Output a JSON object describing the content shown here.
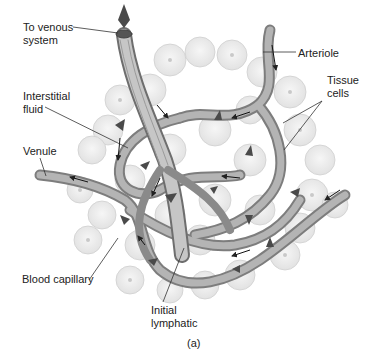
{
  "figure": {
    "panel_label": "(a)",
    "labels": {
      "venous": "To venous\nsystem",
      "interstitial": "Interstitial\nfluid",
      "venule": "Venule",
      "blood_capillary": "Blood capillary",
      "initial_lymphatic": "Initial\nlymphatic",
      "arteriole": "Arteriole",
      "tissue_cells": "Tissue\ncells"
    },
    "colors": {
      "cell_fill": "#ececec",
      "cell_stroke": "#d0d0d0",
      "vessel": "#9a9a9a",
      "vessel_dark": "#6e6e6e",
      "arrow": "#444444",
      "text": "#222222"
    }
  }
}
